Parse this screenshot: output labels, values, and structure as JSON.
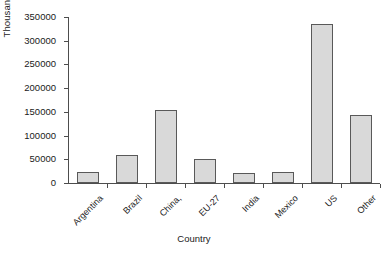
{
  "chart_data": {
    "type": "bar",
    "title": "",
    "xlabel": "Country",
    "ylabel": "Thousand tonnes",
    "categories": [
      "Argentina",
      "Brazil",
      "China,",
      "EU-27",
      "India",
      "Mexico",
      "US",
      "Other"
    ],
    "values": [
      23000,
      58000,
      154000,
      50000,
      21000,
      24000,
      335000,
      143000
    ],
    "ylim": [
      0,
      350000
    ],
    "yticks": [
      0,
      50000,
      100000,
      150000,
      200000,
      250000,
      300000,
      350000
    ],
    "ytick_labels": [
      "0",
      "50000",
      "100000",
      "150000",
      "200000",
      "250000",
      "300000",
      "350000"
    ],
    "grid": false,
    "legend": "none",
    "bar_fill_color": "#d9d9d9",
    "bar_border_color": "#595959",
    "axis_color": "#4d4d4d",
    "background_color": "#ffffff"
  }
}
